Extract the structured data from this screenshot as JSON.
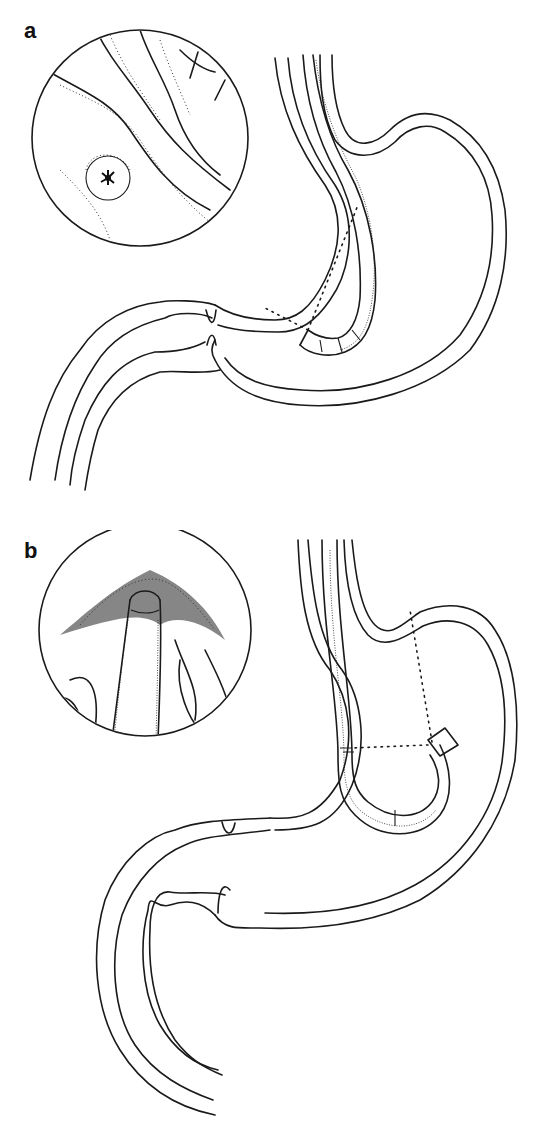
{
  "figure": {
    "panels": [
      {
        "label": "a",
        "inset": "endoscopic-view-pylorus",
        "description": "Endoscope in stomach, forward view toward pylorus"
      },
      {
        "label": "b",
        "inset": "retroflexed-view-cardia",
        "description": "Endoscope retroflexed in stomach viewing cardia"
      }
    ],
    "colors": {
      "ink": "#1a1a1a",
      "background": "#ffffff"
    }
  }
}
